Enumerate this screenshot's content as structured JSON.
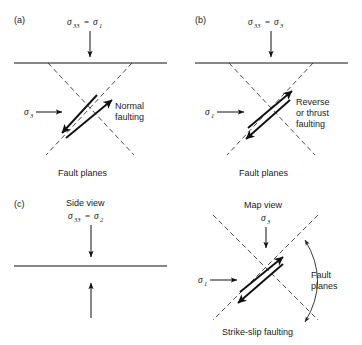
{
  "figure": {
    "background": "#ffffff",
    "ink": "#111111"
  },
  "panels": [
    {
      "key": "a",
      "label": "(a)",
      "vertical_stress_label": "σ33 = σ1",
      "vertical_stress_sigma": "σ",
      "vertical_stress_sub1": "33",
      "vertical_stress_eq": "=",
      "vertical_stress_sigma2": "σ",
      "vertical_stress_sub2": "1",
      "horizontal_stress_sigma": "σ",
      "horizontal_stress_sub": "3",
      "fault_type_line1": "Normal",
      "fault_type_line2": "faulting",
      "fault_planes_label": "Fault planes"
    },
    {
      "key": "b",
      "label": "(b)",
      "vertical_stress_label": "σ33 = σ3",
      "vertical_stress_sigma": "σ",
      "vertical_stress_sub1": "33",
      "vertical_stress_eq": "=",
      "vertical_stress_sigma2": "σ",
      "vertical_stress_sub2": "3",
      "horizontal_stress_sigma": "σ",
      "horizontal_stress_sub": "1",
      "fault_type_line1": "Reverse",
      "fault_type_line2": "or thrust",
      "fault_type_line3": "faulting",
      "fault_planes_label": "Fault planes"
    },
    {
      "key": "c",
      "label": "(c)",
      "view_label": "Side view",
      "vertical_stress_sigma": "σ",
      "vertical_stress_sub1": "33",
      "vertical_stress_eq": "=",
      "vertical_stress_sigma2": "σ",
      "vertical_stress_sub2": "2"
    },
    {
      "key": "d",
      "view_label": "Map view",
      "vertical_stress_sigma": "σ",
      "vertical_stress_sub1": "3",
      "horizontal_stress_sigma": "σ",
      "horizontal_stress_sub": "1",
      "fault_planes_line1": "Fault",
      "fault_planes_line2": "planes",
      "caption": "Strike-slip faulting"
    }
  ]
}
